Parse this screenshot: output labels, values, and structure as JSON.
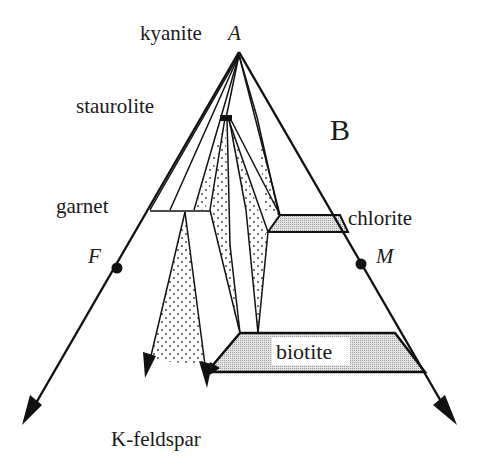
{
  "diagram": {
    "type": "AFM projection (Thompson diagram)",
    "panel_label": "B",
    "apex": {
      "mineral": "kyanite",
      "symbol": "A"
    },
    "poles": [
      {
        "symbol": "F"
      },
      {
        "symbol": "M"
      }
    ],
    "phases": {
      "kyanite": "kyanite",
      "staurolite": "staurolite",
      "garnet": "garnet",
      "chlorite": "chlorite",
      "biotite": "biotite",
      "kfeldspar": "K-feldspar"
    },
    "colors": {
      "line": "#111111",
      "shaded_field": "#cfcfcf",
      "stipple": "#333333",
      "background": "#ffffff"
    }
  }
}
